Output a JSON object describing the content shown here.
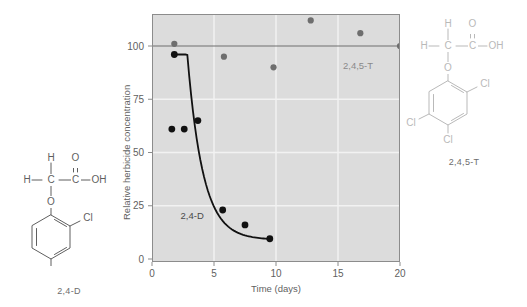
{
  "figure": {
    "background": "#ffffff",
    "plot_background": "#dcdcdc",
    "grid_color": "#f2f2f2",
    "frame_color": "#8c8c8c"
  },
  "chart_data": {
    "type": "scatter",
    "title": "",
    "xlabel": "Time (days)",
    "ylabel": "Relative herbicide concentration",
    "xlim": [
      0,
      20
    ],
    "ylim": [
      0,
      118
    ],
    "xticks": [
      0,
      5,
      10,
      15,
      20
    ],
    "yticks": [
      0,
      25,
      50,
      75,
      100
    ],
    "grid": true,
    "legend": "inline-annotations",
    "series": [
      {
        "name": "2,4-D",
        "color": "#111111",
        "marker": "filled-circle",
        "has_fit_curve": true,
        "annotation": {
          "label": "2,4-D",
          "x": 2.3,
          "y": 19
        },
        "points": [
          {
            "x": 1.8,
            "y": 96
          },
          {
            "x": 1.6,
            "y": 61
          },
          {
            "x": 2.6,
            "y": 61
          },
          {
            "x": 3.7,
            "y": 65
          },
          {
            "x": 5.7,
            "y": 23
          },
          {
            "x": 7.5,
            "y": 16
          },
          {
            "x": 9.5,
            "y": 9.5
          }
        ]
      },
      {
        "name": "2,4,5-T",
        "color": "#6e6e6e",
        "marker": "filled-circle",
        "has_fit_curve": true,
        "annotation": {
          "label": "2,4,5-T",
          "x": 15.4,
          "y": 89
        },
        "points": [
          {
            "x": 1.8,
            "y": 101
          },
          {
            "x": 5.8,
            "y": 95
          },
          {
            "x": 9.8,
            "y": 90
          },
          {
            "x": 12.8,
            "y": 112
          },
          {
            "x": 16.8,
            "y": 106
          },
          {
            "x": 20.0,
            "y": 100
          }
        ]
      }
    ],
    "tick_labels": {
      "x": [
        "0",
        "5",
        "10",
        "15",
        "20"
      ],
      "y": [
        "0",
        "25",
        "50",
        "75",
        "100"
      ]
    }
  },
  "structures": {
    "left": {
      "name": "2,4-D",
      "atoms": {
        "h_top": "H",
        "h_left": "H",
        "c_alpha": "C",
        "c_carboxyl": "C",
        "o_double": "O",
        "oh": "OH",
        "o_ether": "O",
        "cl_2": "Cl",
        "cl_4": "Cl"
      }
    },
    "right": {
      "name": "2,4,5-T",
      "atoms": {
        "h_top": "H",
        "h_left": "H",
        "c_alpha": "C",
        "c_carboxyl": "C",
        "o_double": "O",
        "oh": "OH",
        "o_ether": "O",
        "cl_2": "Cl",
        "cl_4": "Cl",
        "cl_5": "Cl"
      }
    }
  }
}
